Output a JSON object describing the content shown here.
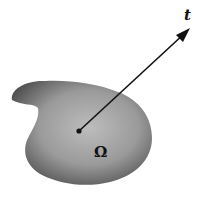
{
  "figure": {
    "region_label": "Ω",
    "vector_label": "t",
    "colors": {
      "background": "#ffffff",
      "region_center": "#b8b8b8",
      "region_edge": "#4a4a4a",
      "ink": "#111111"
    }
  }
}
